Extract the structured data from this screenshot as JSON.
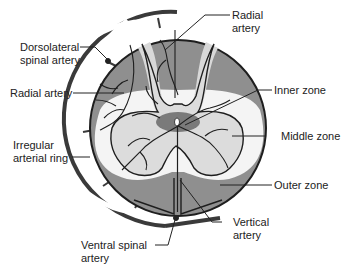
{
  "diagram": {
    "colors": {
      "outer_zone": "#8f8f8f",
      "middle_zone": "#dcdcdc",
      "inner_zone": "#7a7a7a",
      "white_matter_light": "#f2f2f2",
      "outline": "#1e1e1e",
      "ring": "#3a3a3a",
      "ring_gap": "#ffffff",
      "label_text": "#222222"
    },
    "labels": {
      "dorsolateral_spinal_artery": "Dorsolateral\nspinal artery",
      "radial_artery_left": "Radial artery",
      "radial_artery_top": "Radial\nartery",
      "irregular_arterial_ring": "Irregular\narterial ring",
      "inner_zone": "Inner zone",
      "middle_zone": "Middle zone",
      "outer_zone": "Outer zone",
      "vertical_artery": "Vertical\nartery",
      "ventral_spinal_artery": "Ventral spinal\nartery"
    }
  }
}
